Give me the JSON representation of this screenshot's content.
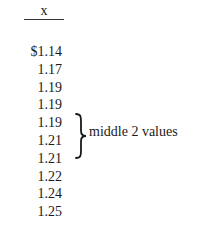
{
  "table": {
    "column_header": "x",
    "values": [
      "$1.14",
      "1.17",
      "1.19",
      "1.19",
      "1.19",
      "1.21",
      "1.21",
      "1.22",
      "1.24",
      "1.25"
    ]
  },
  "annotation": {
    "brace_icon": "right-curly-brace",
    "label": "middle 2 values",
    "spans_rows": [
      4,
      5
    ]
  }
}
